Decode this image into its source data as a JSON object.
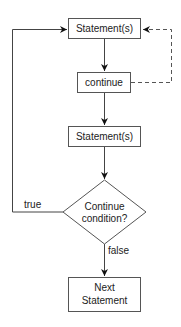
{
  "diagram": {
    "type": "flowchart",
    "nodes": [
      {
        "id": "statements1",
        "shape": "rect",
        "label": "Statement(s)"
      },
      {
        "id": "continue",
        "shape": "rect",
        "label": "continue"
      },
      {
        "id": "statements2",
        "shape": "rect",
        "label": "Statement(s)"
      },
      {
        "id": "condition",
        "shape": "diamond",
        "label_line1": "Continue",
        "label_line2": "condition?"
      },
      {
        "id": "next",
        "shape": "rect",
        "label_line1": "Next",
        "label_line2": "Statement"
      }
    ],
    "edges": [
      {
        "from": "statements1",
        "to": "continue",
        "style": "solid"
      },
      {
        "from": "continue",
        "to": "statements2",
        "style": "solid"
      },
      {
        "from": "statements2",
        "to": "condition",
        "style": "solid"
      },
      {
        "from": "condition",
        "to": "statements1",
        "style": "solid",
        "label": "true"
      },
      {
        "from": "condition",
        "to": "next",
        "style": "solid",
        "label": "false"
      },
      {
        "from": "continue",
        "to": "statements1",
        "style": "dashed"
      }
    ],
    "edge_labels": {
      "true": "true",
      "false": "false"
    }
  }
}
